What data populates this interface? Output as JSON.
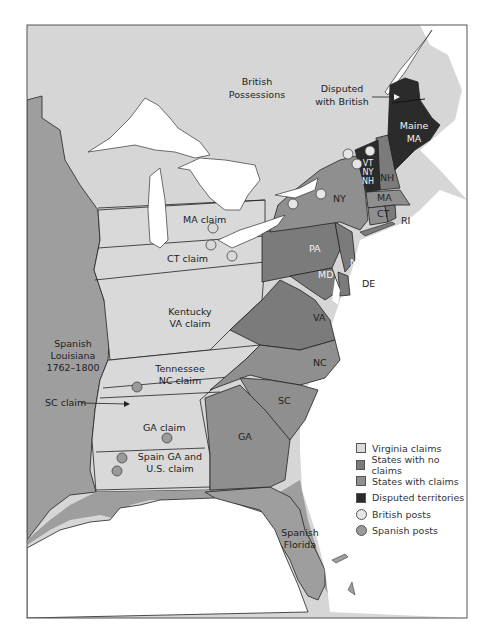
{
  "map": {
    "colors": {
      "british": "#d6d6d6",
      "virginia_claims": "#d9d9d9",
      "spanish_territory": "#9e9e9e",
      "states_no_claims": "#7b7b7b",
      "states_with_claims": "#8f8f8f",
      "disputed": "#2b2b2b",
      "water": "#ffffff",
      "british_post": "#e6e6e6",
      "spanish_post": "#9a9a9a"
    },
    "labels": {
      "british_possessions": [
        "British",
        "Possessions"
      ],
      "disputed_with_british": [
        "Disputed",
        "with British"
      ],
      "maine": [
        "Maine",
        "MA"
      ],
      "vt": [
        "VT",
        "NY",
        "NH"
      ],
      "nh": "NH",
      "ma": "MA",
      "ct": "CT",
      "ri": "RI",
      "ny": "NY",
      "pa": "PA",
      "nj": "NJ",
      "md": "MD",
      "de": "DE",
      "va": "VA",
      "nc": "NC",
      "sc": "SC",
      "ga": "GA",
      "ma_claim": "MA  claim",
      "ct_claim": "CT  claim",
      "kentucky": [
        "Kentucky",
        "VA claim"
      ],
      "tennessee": [
        "Tennessee",
        "NC claim"
      ],
      "sc_claim": "SC claim",
      "ga_claim": "GA claim",
      "spain_ga_us": [
        "Spain  GA and",
        "U.S.  claim"
      ],
      "spanish_louisiana": [
        "Spanish",
        "Louisiana",
        "1762–1800"
      ],
      "spanish_florida": [
        "Spanish",
        "Florida"
      ]
    }
  },
  "legend": {
    "items": [
      {
        "label": "Virginia claims",
        "type": "swatch",
        "color": "#d9d9d9"
      },
      {
        "label": "States with no claims",
        "type": "swatch",
        "color": "#7b7b7b"
      },
      {
        "label": "States with claims",
        "type": "swatch",
        "color": "#8f8f8f"
      },
      {
        "label": "Disputed territories",
        "type": "swatch",
        "color": "#2b2b2b"
      },
      {
        "label": "British posts",
        "type": "dot",
        "color": "#e6e6e6"
      },
      {
        "label": "Spanish posts",
        "type": "dot",
        "color": "#9a9a9a"
      }
    ]
  }
}
